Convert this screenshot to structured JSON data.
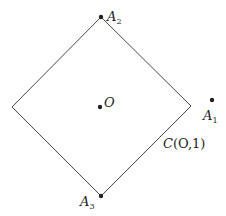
{
  "diagram": {
    "type": "geometry",
    "shape": {
      "name": "C(O,1)",
      "kind": "square-rotated-45 (unit circle in L1 norm)",
      "vertices": {
        "top": [
          101,
          17
        ],
        "right": [
          191,
          106
        ],
        "bottom": [
          101,
          196
        ],
        "left": [
          12,
          107
        ]
      },
      "stroke": "#333333"
    },
    "points": [
      {
        "id": "A2",
        "label_main": "A",
        "label_sub": "2",
        "x": 101,
        "y": 17,
        "label_x": 107,
        "label_y": 21
      },
      {
        "id": "A1",
        "label_main": "A",
        "label_sub": "1",
        "x": 212,
        "y": 100,
        "label_x": 203,
        "label_y": 120
      },
      {
        "id": "A3",
        "label_main": "A",
        "label_sub": "3",
        "x": 101,
        "y": 196,
        "label_x": 80,
        "label_y": 206
      },
      {
        "id": "O",
        "label_main": "O",
        "label_sub": "",
        "x": 100,
        "y": 107,
        "label_x": 104,
        "label_y": 107
      }
    ],
    "curve_label": {
      "main": "C",
      "args": "(O,1)",
      "x": 163,
      "y": 148
    },
    "colors": {
      "ink": "#222222",
      "background": "#ffffff"
    }
  }
}
